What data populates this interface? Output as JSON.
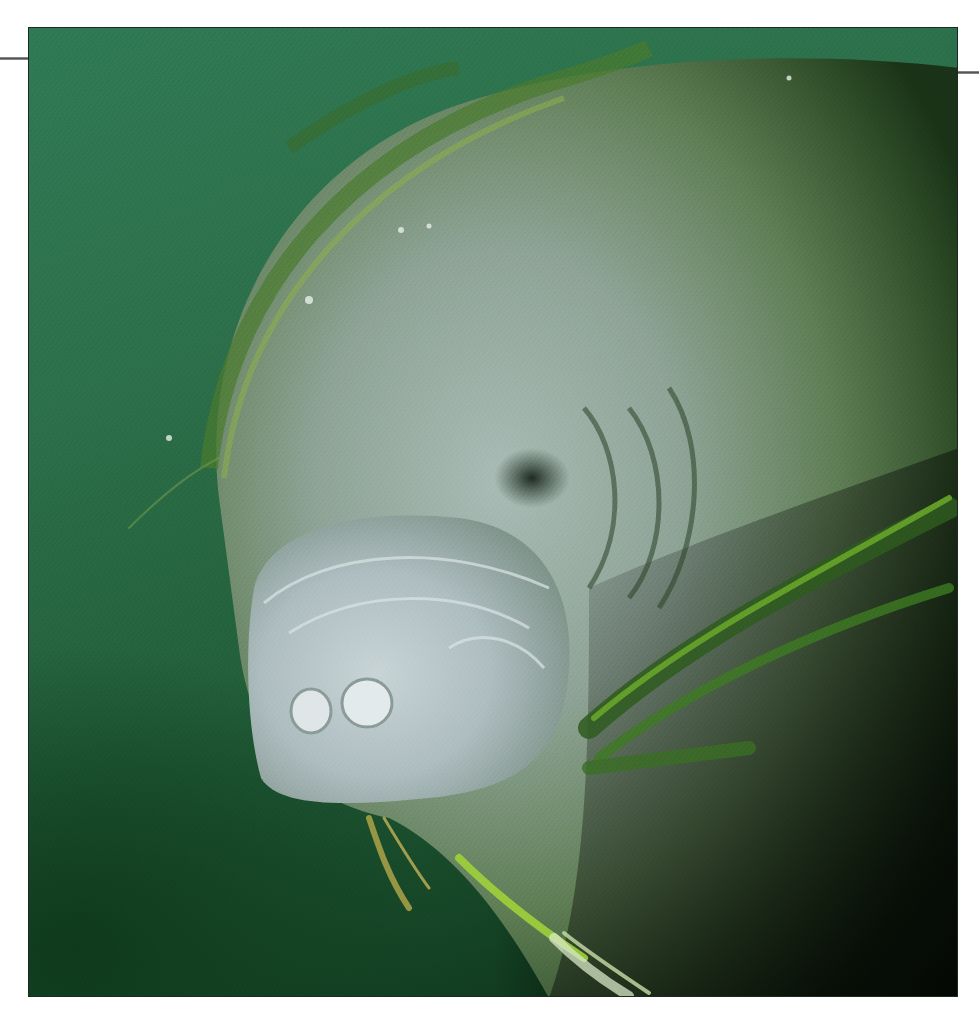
{
  "image": {
    "subject": "manatee underwater with seagrass",
    "colors": {
      "water_light": "#2f7a55",
      "water_dark": "#0a2a14",
      "shadow": "#020602",
      "skin_light": "#b9c7c6",
      "skin_mid": "#8fa39a",
      "skin_green": "#6f8a63",
      "grass_bright": "#9ed23a",
      "grass_dark": "#2e5a1e",
      "page_background": "#ffffff",
      "rule": "#666666"
    }
  }
}
